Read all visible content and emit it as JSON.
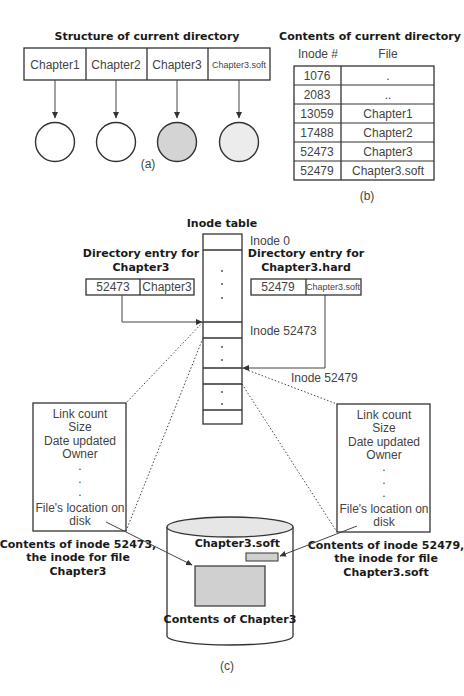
{
  "panel_a": {
    "title": "Structure of current directory",
    "entries": [
      "Chapter1",
      "Chapter2",
      "Chapter3",
      "Chapter3.soft"
    ],
    "circle_fills": [
      "#ffffff",
      "#ffffff",
      "#d4d4d4",
      "#ececec"
    ],
    "caption": "(a)"
  },
  "panel_b": {
    "title": "Contents of current directory",
    "headers": [
      "Inode #",
      "File"
    ],
    "rows": [
      {
        "inode": "1076",
        "file": "."
      },
      {
        "inode": "2083",
        "file": ".."
      },
      {
        "inode": "13059",
        "file": "Chapter1"
      },
      {
        "inode": "17488",
        "file": "Chapter2"
      },
      {
        "inode": "52473",
        "file": "Chapter3"
      },
      {
        "inode": "52479",
        "file": "Chapter3.soft"
      }
    ],
    "caption": "(b)"
  },
  "panel_c": {
    "inode_table_title": "Inode table",
    "inode_labels": {
      "zero": "Inode 0",
      "first": "Inode 52473",
      "second": "Inode 52479"
    },
    "left_entry": {
      "title_line1": "Directory entry for",
      "title_line2": "Chapter3",
      "inode": "52473",
      "name": "Chapter3"
    },
    "right_entry": {
      "title_line1": "Directory entry for",
      "title_line2": "Chapter3.hard",
      "inode": "52479",
      "name": "Chapter3.soft"
    },
    "inode_fields": [
      "Link count",
      "Size",
      "Date updated",
      "Owner",
      ".",
      ".",
      ".",
      "File's location on",
      "disk"
    ],
    "left_caption": [
      "Contents of inode 52473,",
      "the inode for file",
      "Chapter3"
    ],
    "right_caption": [
      "Contents of inode 52479,",
      "the inode for file",
      "Chapter3.soft"
    ],
    "disk": {
      "soft_label": "Chapter3.soft",
      "content_label": "Contents of Chapter3",
      "content_fill": "#d0d0d0"
    },
    "caption": "(c)"
  }
}
